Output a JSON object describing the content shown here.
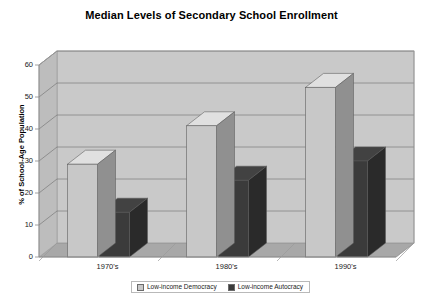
{
  "top_fragment": "",
  "chart_data": {
    "type": "bar",
    "title": "Median Levels of Secondary School Enrollment",
    "xlabel": "",
    "ylabel": "% of School-Age Population",
    "categories": [
      "1970's",
      "1980's",
      "1990's"
    ],
    "series": [
      {
        "name": "Low-income Democracy",
        "values": [
          29,
          41,
          53
        ],
        "color": "#c8c8c8"
      },
      {
        "name": "Low-income Autocracy",
        "values": [
          14,
          24,
          30
        ],
        "color": "#3b3b3b"
      }
    ],
    "ylim": [
      0,
      60
    ],
    "yticks": [
      0,
      10,
      20,
      30,
      40,
      50,
      60
    ],
    "ytick_labels": [
      "0",
      "10",
      "20",
      "30",
      "40",
      "50",
      "60"
    ],
    "grid": true,
    "legend_position": "bottom",
    "style": "3d-column",
    "plot_background": "#c9c9c9",
    "floor_color": "#a8a8a8",
    "gridline_color": "#6e6e6e",
    "frame_color": "#9a9a9a"
  },
  "legend": {
    "items": [
      {
        "label": "Low-income Democracy",
        "swatch": "#c8c8c8"
      },
      {
        "label": "Low-income Autocracy",
        "swatch": "#3b3b3b"
      }
    ]
  }
}
